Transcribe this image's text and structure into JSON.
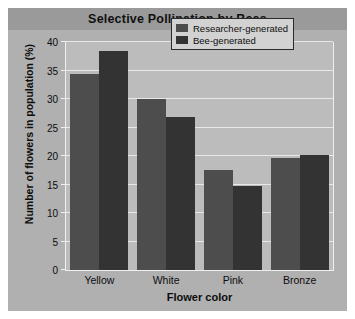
{
  "chart_data": {
    "type": "bar",
    "title": "Selective Pollination by Bees",
    "xlabel": "Flower color",
    "ylabel": "Number of flowers in population (%)",
    "categories": [
      "Yellow",
      "White",
      "Pink",
      "Bronze"
    ],
    "series": [
      {
        "name": "Researcher-generated",
        "color": "#4d4d4d",
        "values": [
          34.4,
          30.0,
          17.5,
          19.6
        ]
      },
      {
        "name": "Bee-generated",
        "color": "#333333",
        "values": [
          38.5,
          26.9,
          14.7,
          20.1
        ]
      }
    ],
    "ylim": [
      0,
      40
    ],
    "yticks": [
      0,
      5,
      10,
      15,
      20,
      25,
      30,
      35,
      40
    ],
    "grid": true,
    "legend_position": "top-right"
  }
}
